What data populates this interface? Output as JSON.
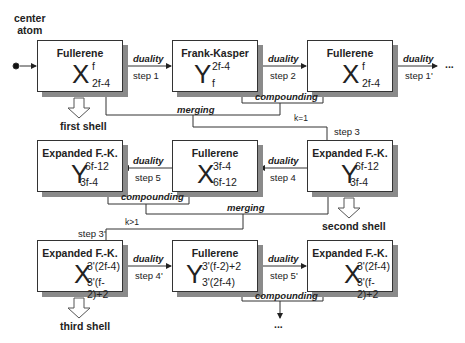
{
  "center_atom": "center\natom",
  "center_atom_l1": "center",
  "center_atom_l2": "atom",
  "boxes": [
    {
      "title": "Fullerene",
      "symbol": "X",
      "sup": "f",
      "sub": "2f-4"
    },
    {
      "title": "Frank-Kasper",
      "symbol": "Y",
      "sup": "2f-4",
      "sub": "f"
    },
    {
      "title": "Fullerene",
      "symbol": "X",
      "sup": "f",
      "sub": "2f-4"
    },
    {
      "title": "Expanded F.-K.",
      "symbol": "Y",
      "sup": "6f-12",
      "sub": "3f-4"
    },
    {
      "title": "Fullerene",
      "symbol": "X",
      "sup": "3f-4",
      "sub": "6f-12"
    },
    {
      "title": "Expanded F.-K.",
      "symbol": "Y",
      "sup": "6f-12",
      "sub": "3f-4"
    },
    {
      "title": "Expanded F.-K.",
      "symbol": "X",
      "sup": "3'(2f-4)",
      "sub": "3'(f-2)+2"
    },
    {
      "title": "Fullerene",
      "symbol": "Y",
      "sup": "3'(f-2)+2",
      "sub": "3'(2f-4)"
    },
    {
      "title": "Expanded F.-K.",
      "symbol": "X",
      "sup": "3'(2f-4)",
      "sub": "3'(f-2)+2"
    }
  ],
  "labels": {
    "duality": "duality",
    "compounding": "compounding",
    "merging": "merging",
    "step1": "step 1",
    "step2": "step 2",
    "step1p": "step 1'",
    "step3": "step 3",
    "step4": "step 4",
    "step5": "step 5",
    "step3p": "step 3'",
    "step4p": "step 4'",
    "step5p": "step 5'",
    "k1": "k=1",
    "kgt1": "k>1",
    "first_shell": "first shell",
    "second_shell": "second shell",
    "third_shell": "third shell",
    "ellipsis": "..."
  }
}
